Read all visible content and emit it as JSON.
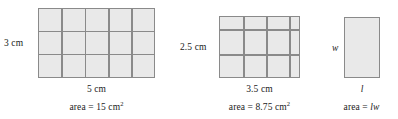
{
  "diagram": {
    "fill_color": "#e9e9e9",
    "line_color": "#8a8a8a",
    "figures": [
      {
        "id": "unit-15",
        "width_label": "5 cm",
        "height_label": "3 cm",
        "area_prefix": "area = 15 cm",
        "area_exponent": "2",
        "grid": {
          "cols": 5,
          "rows": 3,
          "col_widths": [
            1,
            1,
            1,
            1,
            1
          ],
          "row_heights": [
            1,
            1,
            1
          ]
        },
        "length_value": 5,
        "width_value": 3,
        "area_value": 15,
        "units": "cm"
      },
      {
        "id": "unit-875",
        "width_label": "3.5 cm",
        "height_label": "2.5 cm",
        "area_prefix": "area = 8.75 cm",
        "area_exponent": "2",
        "grid": {
          "cols": 4,
          "rows": 3,
          "col_widths": [
            1,
            1,
            1,
            0.5
          ],
          "row_heights": [
            0.5,
            1,
            1
          ]
        },
        "length_value": 3.5,
        "width_value": 2.5,
        "area_value": 8.75,
        "units": "cm"
      },
      {
        "id": "general",
        "width_label": "l",
        "height_label": "w",
        "area_prefix": "area = ",
        "area_variables": "lw",
        "grid": {
          "cols": 1,
          "rows": 1,
          "col_widths": [
            1
          ],
          "row_heights": [
            1
          ]
        },
        "length_value": null,
        "width_value": null,
        "area_value": null,
        "units": null
      }
    ]
  }
}
